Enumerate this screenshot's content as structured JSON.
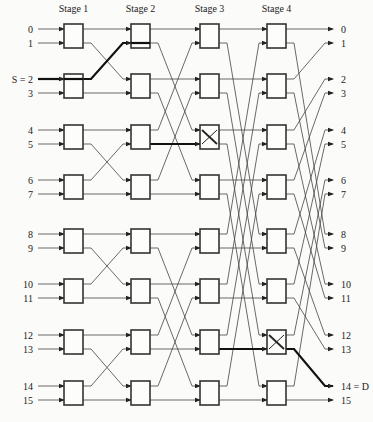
{
  "stages": [
    {
      "label": "Stage 1",
      "x": 64
    },
    {
      "label": "Stage 2",
      "x": 131
    },
    {
      "label": "Stage 3",
      "x": 200
    },
    {
      "label": "Stage 4",
      "x": 267
    }
  ],
  "box_width": 19,
  "line_y": [
    29,
    43,
    79,
    93,
    130,
    144,
    180,
    194,
    234,
    248,
    284,
    298,
    335,
    349,
    386,
    400
  ],
  "inputs": [
    "0",
    "1",
    "S = 2",
    "3",
    "4",
    "5",
    "6",
    "7",
    "8",
    "9",
    "10",
    "11",
    "12",
    "13",
    "14",
    "15"
  ],
  "outputs": [
    "0",
    "1",
    "2",
    "3",
    "4",
    "5",
    "6",
    "7",
    "8",
    "9",
    "10",
    "11",
    "12",
    "13",
    "14 = D",
    "15"
  ],
  "source_label": "S = 2",
  "destination_label": "14 = D",
  "crossed_boxes": [
    {
      "stage": 3,
      "box": 2
    },
    {
      "stage": 4,
      "box": 6
    }
  ],
  "route": {
    "source": 2,
    "destination": 14,
    "path_description": "Input 2 -> Stage1 box1 upper (straight) -> Stage2 box0 lower (straight) -> Stage3 box2 upper (crossed) -> Stage4 box6 upper (crossed) -> Output 14"
  },
  "colors": {
    "wire": "#444444",
    "box": "#333333",
    "path": "#111111",
    "background": "#fbfbf9"
  }
}
